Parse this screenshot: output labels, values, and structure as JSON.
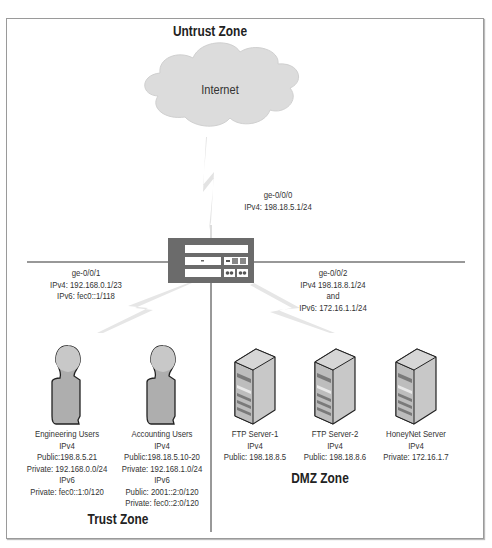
{
  "zones": {
    "untrust": "Untrust Zone",
    "trust": "Trust Zone",
    "dmz": "DMZ Zone"
  },
  "cloud": {
    "label": "Internet"
  },
  "interfaces": {
    "untrust": {
      "name": "ge-0/0/0",
      "ipv4": "IPv4: 198.18.5.1/24"
    },
    "trust": {
      "name": "ge-0/0/1",
      "ipv4": "IPv4: 192.168.0.1/23",
      "ipv6": "IPv6: fec0::1/118"
    },
    "dmz": {
      "name": "ge-0/0/2",
      "ipv4": "IPv4 198.18.8.1/24",
      "and": "and",
      "ipv6": "IPv6: 172.16.1.1/24"
    }
  },
  "users": [
    {
      "name": "Engineering Users",
      "lines": [
        "IPv4",
        "Public:198.8.5.21",
        "Private: 192.168.0.0/24",
        "IPv6",
        "Private: fec0::1:0/120"
      ]
    },
    {
      "name": "Accounting Users",
      "lines": [
        "IPv4",
        "Public:198.18.5.10-20",
        "Private: 192.168.1.0/24",
        "IPv6",
        "Public: 2001::2:0/120",
        "Private: fec0::2:0/120"
      ]
    }
  ],
  "servers": [
    {
      "name": "FTP Server-1",
      "lines": [
        "IPv4",
        "Public: 198.18.8.5"
      ]
    },
    {
      "name": "FTP Server-2",
      "lines": [
        "IPv4",
        "Public: 198.18.8.6"
      ]
    },
    {
      "name": "HoneyNet Server",
      "lines": [
        "IPv4",
        "Private: 172.16.1.7"
      ]
    }
  ],
  "colors": {
    "frame": "#9a9a9a",
    "cloud_fill": "#dcdcdc",
    "device_fill": "#6b6b6b",
    "person_fill": "#b0b0b0",
    "server_front": "#b8b8b8",
    "server_side": "#d0d0d0",
    "bolt": "#e6e6e6",
    "line": "#333333"
  }
}
